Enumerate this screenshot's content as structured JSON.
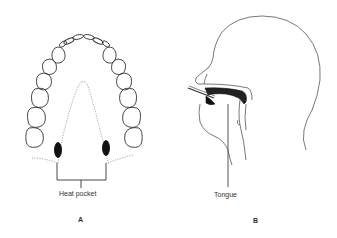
{
  "figure": {
    "panels": [
      {
        "id": "A",
        "letter": "A",
        "subject": "upper-dental-arch-occlusal-view",
        "callout_label": "Heat pocket"
      },
      {
        "id": "B",
        "letter": "B",
        "subject": "head-profile-with-oral-probe",
        "callout_label": "Tongue"
      }
    ],
    "colors": {
      "line": "#333333",
      "dotted": "#777777",
      "fill_dark": "#111111",
      "background": "#ffffff"
    }
  }
}
